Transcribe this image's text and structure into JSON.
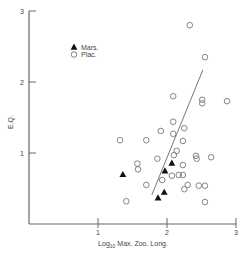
{
  "chart_data": {
    "type": "scatter",
    "title": "",
    "xlabel": "Log10 Max. Zoo. Long.",
    "xlabel_main": "Log",
    "xlabel_sub": "10",
    "xlabel_rest": " Max. Zoo. Long.",
    "ylabel": "E.Q.",
    "xlim": [
      0,
      3
    ],
    "ylim": [
      0,
      3
    ],
    "x_ticks": [
      1,
      2,
      3
    ],
    "y_ticks": [
      1,
      2,
      3
    ],
    "x_tick_labels": [
      "1",
      "2",
      "3"
    ],
    "y_tick_labels": [
      "1",
      "2",
      "3"
    ],
    "grid": false,
    "legend_position": "upper-left",
    "legend": [
      {
        "label": "Mars.",
        "marker": "filled-triangle"
      },
      {
        "label": "Plac.",
        "marker": "open-circle"
      }
    ],
    "series": [
      {
        "name": "Mars.",
        "marker": "filled-triangle",
        "points": [
          [
            1.36,
            0.7
          ],
          [
            2.07,
            0.86
          ],
          [
            1.97,
            0.75
          ],
          [
            1.96,
            0.45
          ],
          [
            1.87,
            0.37
          ]
        ]
      },
      {
        "name": "Plac.",
        "marker": "open-circle",
        "points": [
          [
            2.33,
            2.8
          ],
          [
            2.55,
            2.35
          ],
          [
            2.09,
            1.8
          ],
          [
            2.51,
            1.75
          ],
          [
            2.51,
            1.7
          ],
          [
            2.87,
            1.73
          ],
          [
            2.09,
            1.44
          ],
          [
            1.91,
            1.31
          ],
          [
            2.09,
            1.27
          ],
          [
            2.25,
            1.35
          ],
          [
            2.23,
            1.17
          ],
          [
            1.32,
            1.18
          ],
          [
            1.7,
            1.18
          ],
          [
            2.14,
            1.03
          ],
          [
            2.1,
            0.97
          ],
          [
            2.42,
            0.96
          ],
          [
            2.43,
            0.92
          ],
          [
            2.64,
            0.94
          ],
          [
            1.86,
            0.92
          ],
          [
            1.57,
            0.85
          ],
          [
            1.58,
            0.77
          ],
          [
            2.23,
            0.83
          ],
          [
            1.93,
            0.62
          ],
          [
            2.07,
            0.68
          ],
          [
            2.17,
            0.69
          ],
          [
            2.23,
            0.69
          ],
          [
            1.7,
            0.55
          ],
          [
            2.3,
            0.55
          ],
          [
            2.25,
            0.49
          ],
          [
            2.46,
            0.54
          ],
          [
            2.55,
            0.54
          ],
          [
            2.55,
            0.31
          ],
          [
            1.41,
            0.32
          ]
        ]
      }
    ],
    "regression_line": {
      "x1": 1.78,
      "y1": 0.41,
      "x2": 2.52,
      "y2": 2.17
    }
  }
}
